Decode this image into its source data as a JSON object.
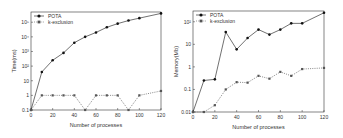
{
  "chart_data": [
    {
      "type": "line",
      "title": "",
      "xlabel": "Number of processes",
      "ylabel": "Time(ms)",
      "yscale": "log",
      "ylim": [
        0.1,
        500000
      ],
      "xlim": [
        0,
        120
      ],
      "x_ticks": [
        0,
        20,
        40,
        60,
        80,
        100,
        120
      ],
      "y_ticks": [
        {
          "value": 0.1,
          "label": "0.1"
        },
        {
          "value": 1,
          "label": "1"
        },
        {
          "value": 10,
          "label": "10"
        },
        {
          "value": 100,
          "label": "10²"
        },
        {
          "value": 1000,
          "label": "10³"
        },
        {
          "value": 10000,
          "label": "10⁴"
        },
        {
          "value": 100000,
          "label": "10⁵"
        }
      ],
      "grid": false,
      "legend_position": "upper left",
      "x": [
        0,
        10,
        20,
        30,
        40,
        50,
        60,
        70,
        80,
        90,
        100,
        120
      ],
      "series": [
        {
          "name": "POTA",
          "style": "solid",
          "marker": "circle",
          "values": [
            0.1,
            40,
            250,
            800,
            4000,
            10000,
            20000,
            45000,
            80000,
            130000,
            190000,
            400000
          ]
        },
        {
          "name": "k-exclusion",
          "style": "dotted",
          "marker": "square",
          "values": [
            0.1,
            1,
            1,
            1,
            1,
            0.1,
            1,
            1,
            1,
            0.1,
            1,
            2
          ]
        }
      ]
    },
    {
      "type": "line",
      "title": "",
      "xlabel": "Number of processes",
      "ylabel": "Memory(Mb)",
      "yscale": "log",
      "ylim": [
        0.01,
        300
      ],
      "xlim": [
        0,
        120
      ],
      "x_ticks": [
        0,
        20,
        40,
        60,
        80,
        100,
        120
      ],
      "y_ticks": [
        {
          "value": 0.01,
          "label": "0.01"
        },
        {
          "value": 0.1,
          "label": "0.1"
        },
        {
          "value": 1,
          "label": "1"
        },
        {
          "value": 10,
          "label": "10"
        },
        {
          "value": 100,
          "label": "10²"
        }
      ],
      "grid": false,
      "legend_position": "upper left",
      "x": [
        0,
        10,
        20,
        30,
        40,
        50,
        60,
        70,
        80,
        90,
        100,
        120
      ],
      "series": [
        {
          "name": "POTA",
          "style": "solid",
          "marker": "circle",
          "values": [
            0.01,
            0.25,
            0.28,
            35,
            6,
            19,
            45,
            27,
            45,
            85,
            85,
            250
          ]
        },
        {
          "name": "k-exclusion",
          "style": "dotted",
          "marker": "square",
          "values": [
            0.01,
            0.01,
            0.02,
            0.1,
            0.21,
            0.2,
            0.4,
            0.3,
            0.6,
            0.4,
            0.8,
            0.9
          ]
        }
      ]
    }
  ],
  "colors": {
    "pota": "#111111",
    "kexclusion": "#555555",
    "axis": "#333333"
  }
}
